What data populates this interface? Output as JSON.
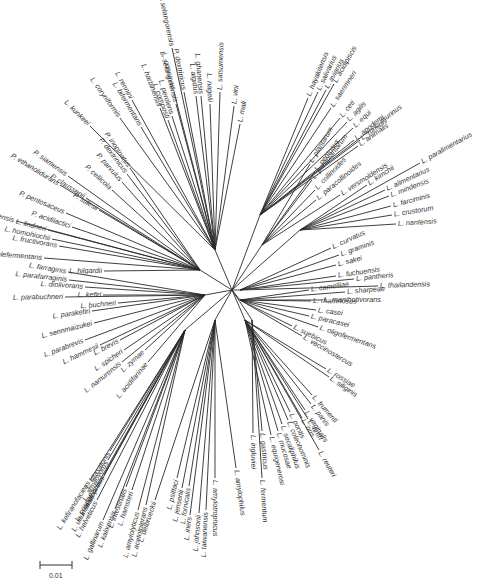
{
  "figure": {
    "type": "unrooted phylogenetic tree",
    "scale_bar": {
      "label": "0.01"
    }
  },
  "root": {
    "x": 232,
    "y": 290
  },
  "clades": [
    {
      "name": "clade-top-right",
      "anchor": [
        260,
        215
      ],
      "leaves": [
        {
          "label": "L. hayakitensis",
          "x": 308,
          "y": 98,
          "angle": -78
        },
        {
          "label": "L. salivarius",
          "x": 318,
          "y": 92,
          "angle": -74
        },
        {
          "label": "L. aviarius",
          "x": 326,
          "y": 90,
          "angle": -72
        },
        {
          "label": "L. acidipiscis",
          "x": 334,
          "y": 84,
          "angle": -68
        },
        {
          "label": "L. saerimneri",
          "x": 331,
          "y": 108,
          "angle": -66
        },
        {
          "label": "L. ceti",
          "x": 340,
          "y": 118,
          "angle": -60
        },
        {
          "label": "L. agilis",
          "x": 347,
          "y": 122,
          "angle": -58
        },
        {
          "label": "L. equi",
          "x": 353,
          "y": 128,
          "angle": -56
        },
        {
          "label": "L. ruminis",
          "x": 360,
          "y": 140,
          "angle": -50
        },
        {
          "label": "L. apodemi",
          "x": 354,
          "y": 140,
          "angle": -40
        },
        {
          "label": "L. animalis",
          "x": 358,
          "y": 146,
          "angle": -36
        },
        {
          "label": "L. murinus",
          "x": 373,
          "y": 128,
          "angle": -20
        }
      ]
    },
    {
      "name": "clade-plantarum",
      "anchor": [
        262,
        245
      ],
      "leaves": [
        {
          "label": "L. plantarum",
          "x": 310,
          "y": 164,
          "angle": -30
        },
        {
          "label": "L. pentosus",
          "x": 315,
          "y": 172,
          "angle": -28
        },
        {
          "label": "L. paraplantarum",
          "x": 312,
          "y": 180,
          "angle": -25
        },
        {
          "label": "L. collinoides",
          "x": 315,
          "y": 190,
          "angle": -22
        },
        {
          "label": "L. paracollinoides",
          "x": 316,
          "y": 200,
          "angle": -20
        },
        {
          "label": "L. versmoldensis",
          "x": 340,
          "y": 195,
          "angle": -24
        }
      ]
    },
    {
      "name": "clade-alimentarius",
      "anchor": [
        300,
        230
      ],
      "leaves": [
        {
          "label": "L. kimchii",
          "x": 367,
          "y": 185,
          "angle": -30
        },
        {
          "label": "L. paralimentarius",
          "x": 420,
          "y": 163,
          "angle": -26
        },
        {
          "label": "L. alimentarius",
          "x": 385,
          "y": 190,
          "angle": -22
        },
        {
          "label": "L. mindensis",
          "x": 389,
          "y": 196,
          "angle": -18
        },
        {
          "label": "L. farciminis",
          "x": 391,
          "y": 206,
          "angle": -14
        },
        {
          "label": "L. crustorum",
          "x": 392,
          "y": 215,
          "angle": -6
        },
        {
          "label": "L. nantensis",
          "x": 396,
          "y": 224,
          "angle": 6
        }
      ]
    },
    {
      "name": "clade-sakei",
      "anchor": [
        240,
        290
      ],
      "leaves": [
        {
          "label": "L. curvatus",
          "x": 331,
          "y": 248,
          "angle": -20
        },
        {
          "label": "L. graminis",
          "x": 339,
          "y": 255,
          "angle": -10
        },
        {
          "label": "L. sakei",
          "x": 336,
          "y": 265,
          "angle": -4
        },
        {
          "label": "L. fuchuensis",
          "x": 336,
          "y": 276,
          "angle": 2
        },
        {
          "label": "L. pantheris",
          "x": 354,
          "y": 279,
          "angle": 4
        },
        {
          "label": "L. thailandensis",
          "x": 378,
          "y": 286,
          "angle": 10
        }
      ]
    },
    {
      "name": "clade-casei",
      "anchor": [
        240,
        300
      ],
      "leaves": [
        {
          "label": "L. sharpeae",
          "x": 345,
          "y": 292,
          "angle": 10
        },
        {
          "label": "L. camelliae",
          "x": 309,
          "y": 290,
          "angle": 10
        },
        {
          "label": "L. manihotivorans",
          "x": 322,
          "y": 300,
          "angle": 18
        },
        {
          "label": "L. rhamnosus",
          "x": 311,
          "y": 301,
          "angle": 18
        },
        {
          "label": "L. casei",
          "x": 316,
          "y": 310,
          "angle": 22
        },
        {
          "label": "L. paracasei",
          "x": 309,
          "y": 316,
          "angle": 30
        },
        {
          "label": "L. oligofermentans",
          "x": 318,
          "y": 327,
          "angle": 34
        },
        {
          "label": "L. suebicus",
          "x": 292,
          "y": 326,
          "angle": 32
        },
        {
          "label": "L. vaccinostercus",
          "x": 302,
          "y": 336,
          "angle": 38
        }
      ]
    },
    {
      "name": "clade-reuteri",
      "anchor": [
        245,
        320
      ],
      "leaves": [
        {
          "label": "L. rossiae",
          "x": 326,
          "y": 369,
          "angle": 38
        },
        {
          "label": "L. siliginis",
          "x": 329,
          "y": 377,
          "angle": 42
        },
        {
          "label": "L. frumenti",
          "x": 312,
          "y": 395,
          "angle": 36
        },
        {
          "label": "L. panis",
          "x": 311,
          "y": 404,
          "angle": 40
        },
        {
          "label": "L. vaginalis",
          "x": 305,
          "y": 410,
          "angle": 46
        },
        {
          "label": "L. oris",
          "x": 302,
          "y": 418,
          "angle": 52
        },
        {
          "label": "L. antri",
          "x": 308,
          "y": 419,
          "angle": 56
        },
        {
          "label": "L. pontis",
          "x": 290,
          "y": 412,
          "angle": 60
        },
        {
          "label": "L. coleohominis",
          "x": 288,
          "y": 420,
          "angle": 62
        },
        {
          "label": "L. secaliphilus",
          "x": 282,
          "y": 424,
          "angle": 64
        },
        {
          "label": "L. mucosae",
          "x": 278,
          "y": 431,
          "angle": 68
        },
        {
          "label": "L. equigenerosi",
          "x": 271,
          "y": 435,
          "angle": 72
        },
        {
          "label": "L. reuteri",
          "x": 319,
          "y": 450,
          "angle": 58
        }
      ]
    },
    {
      "name": "clade-fermentum",
      "anchor": [
        252,
        320
      ],
      "leaves": [
        {
          "label": "L. ingluviei",
          "x": 253,
          "y": 433,
          "angle": 84
        },
        {
          "label": "L. gastricus",
          "x": 262,
          "y": 431,
          "angle": 84
        },
        {
          "label": "L. fermentum",
          "x": 262,
          "y": 478,
          "angle": 86
        }
      ]
    },
    {
      "name": "clade-delbrueckii",
      "anchor": [
        215,
        320
      ],
      "leaves": [
        {
          "label": "L. amylophilus",
          "x": 236,
          "y": 468,
          "angle": 100
        },
        {
          "label": "L. amylotrophicus",
          "x": 215,
          "y": 478,
          "angle": 100
        },
        {
          "label": "L. iners",
          "x": 190,
          "y": 515,
          "angle": 100
        },
        {
          "label": "L. johnsonii",
          "x": 199,
          "y": 513,
          "angle": 100
        },
        {
          "label": "L. taiwanensis",
          "x": 206,
          "y": 510,
          "angle": 100
        },
        {
          "label": "L. psittaci",
          "x": 177,
          "y": 478,
          "angle": 102
        },
        {
          "label": "L. jensenii",
          "x": 182,
          "y": 488,
          "angle": 102
        },
        {
          "label": "L. fornicalis",
          "x": 189,
          "y": 486,
          "angle": 102
        },
        {
          "label": "L. delbrueckii",
          "x": 155,
          "y": 500,
          "angle": 100
        }
      ]
    },
    {
      "name": "clade-acidophilus",
      "anchor": [
        185,
        330
      ],
      "leaves": [
        {
          "label": "L. kitasatonis",
          "x": 110,
          "y": 451,
          "angle": -20
        },
        {
          "label": "L. amylovorus",
          "x": 108,
          "y": 460,
          "angle": -20
        },
        {
          "label": "L. acidophilus",
          "x": 104,
          "y": 475,
          "angle": -22
        },
        {
          "label": "L. kefiranofaciens",
          "x": 90,
          "y": 480,
          "angle": -30
        },
        {
          "label": "L. crispatus",
          "x": 96,
          "y": 487,
          "angle": -40
        },
        {
          "label": "L. ultunensis",
          "x": 94,
          "y": 494,
          "angle": -44
        },
        {
          "label": "L. helveticus",
          "x": 97,
          "y": 500,
          "angle": -50
        },
        {
          "label": "L. gallinarum",
          "x": 103,
          "y": 520,
          "angle": -70
        },
        {
          "label": "L. kalixensis",
          "x": 115,
          "y": 509,
          "angle": -76
        },
        {
          "label": "L. intestinalis",
          "x": 126,
          "y": 487,
          "angle": -80
        },
        {
          "label": "L. hamsteri",
          "x": 132,
          "y": 490,
          "angle": -80
        },
        {
          "label": "L. amylolyticus",
          "x": 138,
          "y": 510,
          "angle": -80
        },
        {
          "label": "L. acetotolerans",
          "x": 146,
          "y": 505,
          "angle": -84
        }
      ]
    },
    {
      "name": "clade-buchneri",
      "anchor": [
        205,
        295
      ],
      "leaves": [
        {
          "label": "L. farraginis",
          "x": 68,
          "y": 272,
          "angle": -12
        },
        {
          "label": "L. parafarraginis",
          "x": 69,
          "y": 280,
          "angle": -14
        },
        {
          "label": "L. diolivorans",
          "x": 85,
          "y": 287,
          "angle": -18
        },
        {
          "label": "L. parabuchneri",
          "x": 65,
          "y": 297,
          "angle": -22
        },
        {
          "label": "L. kefiri",
          "x": 103,
          "y": 295,
          "angle": -22
        },
        {
          "label": "L. parakefiri",
          "x": 92,
          "y": 311,
          "angle": -30
        },
        {
          "label": "L. buchneri",
          "x": 118,
          "y": 303,
          "angle": -30
        },
        {
          "label": "L. sennmaizukei",
          "x": 94,
          "y": 323,
          "angle": -34
        },
        {
          "label": "L. parabrevis",
          "x": 85,
          "y": 340,
          "angle": -40
        },
        {
          "label": "L. hammesii",
          "x": 100,
          "y": 345,
          "angle": -50
        },
        {
          "label": "L. brevis",
          "x": 120,
          "y": 340,
          "angle": -60
        },
        {
          "label": "L. spicheri",
          "x": 124,
          "y": 350,
          "angle": -60
        },
        {
          "label": "L. namurensis",
          "x": 122,
          "y": 362,
          "angle": -66
        },
        {
          "label": "L. zymae",
          "x": 145,
          "y": 350,
          "angle": -70
        },
        {
          "label": "L. acidifarinae",
          "x": 148,
          "y": 362,
          "angle": -74
        }
      ]
    },
    {
      "name": "clade-pediococcus",
      "anchor": [
        200,
        270
      ],
      "leaves": [
        {
          "label": "L. hilgardii",
          "x": 104,
          "y": 271,
          "angle": -14
        },
        {
          "label": "L. malefermentans",
          "x": 44,
          "y": 258,
          "angle": 8
        },
        {
          "label": "L. fructivorans",
          "x": 59,
          "y": 246,
          "angle": 10
        },
        {
          "label": "L. homohiochii",
          "x": 52,
          "y": 239,
          "angle": 12
        },
        {
          "label": "L. lindneri",
          "x": 48,
          "y": 230,
          "angle": 12
        },
        {
          "label": "L. sanfranciscensis",
          "x": 16,
          "y": 221,
          "angle": 14
        },
        {
          "label": "P. acidilactici",
          "x": 72,
          "y": 227,
          "angle": 18
        },
        {
          "label": "P. pentosaceus",
          "x": 66,
          "y": 213,
          "angle": 18
        },
        {
          "label": "P. stilesii",
          "x": 99,
          "y": 210,
          "angle": 20
        },
        {
          "label": "P. claussenii",
          "x": 86,
          "y": 198,
          "angle": 22
        },
        {
          "label": "P. ethanolidurans",
          "x": 60,
          "y": 185,
          "angle": 22
        },
        {
          "label": "P. siamensis",
          "x": 68,
          "y": 176,
          "angle": 22
        },
        {
          "label": "P. cellicola",
          "x": 112,
          "y": 190,
          "angle": 36
        },
        {
          "label": "P. parvulus",
          "x": 122,
          "y": 182,
          "angle": 40
        },
        {
          "label": "P. dextrinicus",
          "x": 127,
          "y": 174,
          "angle": 42
        },
        {
          "label": "P. inopinatus",
          "x": 130,
          "y": 168,
          "angle": 46
        }
      ]
    },
    {
      "name": "clade-coryniformis",
      "anchor": [
        215,
        250
      ],
      "leaves": [
        {
          "label": "L. kunkeei",
          "x": 90,
          "y": 126,
          "angle": 40
        },
        {
          "label": "L. rennini",
          "x": 132,
          "y": 100,
          "angle": 52
        },
        {
          "label": "L. coryniformis",
          "x": 120,
          "y": 118,
          "angle": 42
        },
        {
          "label": "L. bifermentans",
          "x": 141,
          "y": 127,
          "angle": 52
        },
        {
          "label": "L. composti",
          "x": 168,
          "y": 120,
          "angle": 58
        },
        {
          "label": "L. harbinensis",
          "x": 160,
          "y": 108,
          "angle": 60
        },
        {
          "label": "L. perolens",
          "x": 172,
          "y": 116,
          "angle": 60
        },
        {
          "label": "L. selangorensis",
          "x": 176,
          "y": 104,
          "angle": 62
        },
        {
          "label": "Paralactobacillus selangorensis",
          "x": 172,
          "y": 48,
          "angle": 62
        },
        {
          "label": "L. concavus",
          "x": 174,
          "y": 92,
          "angle": 68
        },
        {
          "label": "P. dextrinicus",
          "x": 184,
          "y": 92,
          "angle": 70
        },
        {
          "label": "L. algidus",
          "x": 196,
          "y": 96,
          "angle": 72
        },
        {
          "label": "L. ghanensis",
          "x": 201,
          "y": 96,
          "angle": 74
        },
        {
          "label": "L. nagelii",
          "x": 210,
          "y": 104,
          "angle": 76
        },
        {
          "label": "L. satsumensis",
          "x": 220,
          "y": 92,
          "angle": 80
        },
        {
          "label": "L. vini",
          "x": 234,
          "y": 106,
          "angle": 82
        },
        {
          "label": "L. mali",
          "x": 240,
          "y": 124,
          "angle": 80
        }
      ]
    }
  ]
}
